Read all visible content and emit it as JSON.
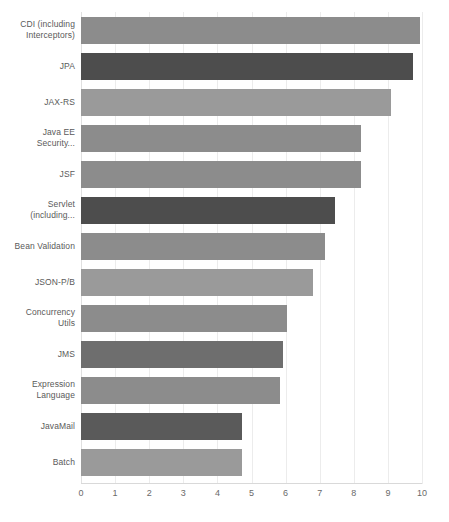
{
  "chart_data": {
    "type": "bar",
    "orientation": "horizontal",
    "title": "",
    "subtitle": "",
    "xlabel": "",
    "ylabel": "",
    "xlim": [
      0,
      10
    ],
    "xticks": [
      "0",
      "1",
      "2",
      "3",
      "4",
      "5",
      "6",
      "7",
      "8",
      "9",
      "10"
    ],
    "grid": true,
    "legend": "none",
    "categories": [
      "CDI (including Interceptors)",
      "JPA",
      "JAX-RS",
      "Java EE Security...",
      "JSF",
      "Servlet (including...",
      "Bean Validation",
      "JSON-P/B",
      "Concurrency Utils",
      "JMS",
      "Expression Language",
      "JavaMail",
      "Batch"
    ],
    "category_lines": [
      [
        "CDI (including",
        "Interceptors)"
      ],
      [
        "JPA"
      ],
      [
        "JAX-RS"
      ],
      [
        "Java EE",
        "Security..."
      ],
      [
        "JSF"
      ],
      [
        "Servlet",
        "(including..."
      ],
      [
        "Bean Validation"
      ],
      [
        "JSON-P/B"
      ],
      [
        "Concurrency",
        "Utils"
      ],
      [
        "JMS"
      ],
      [
        "Expression",
        "Language"
      ],
      [
        "JavaMail"
      ],
      [
        "Batch"
      ]
    ],
    "values": [
      9.95,
      9.75,
      9.1,
      8.2,
      8.2,
      7.45,
      7.15,
      6.8,
      6.05,
      5.92,
      5.85,
      4.72,
      4.72
    ],
    "bar_colors": [
      "#8c8c8c",
      "#4d4d4d",
      "#9a9a9a",
      "#8c8c8c",
      "#8c8c8c",
      "#4d4d4d",
      "#8c8c8c",
      "#9a9a9a",
      "#8c8c8c",
      "#6e6e6e",
      "#8c8c8c",
      "#5a5a5a",
      "#9a9a9a"
    ]
  },
  "colors": {
    "background": "#ffffff",
    "gridline": "#ececec",
    "axis": "#d9d9d9",
    "tick_text": "#6a6a6a",
    "label_text": "#5a5a5a",
    "bar_light": "#9a9a9a",
    "bar_medium": "#8c8c8c",
    "bar_dark": "#4d4d4d"
  }
}
